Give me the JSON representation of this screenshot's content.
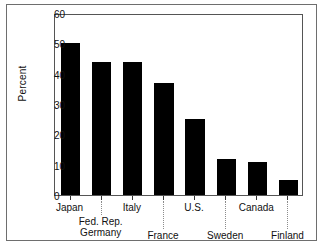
{
  "chart_data": {
    "type": "bar",
    "title": "",
    "xlabel": "",
    "ylabel": "Percent",
    "ylim": [
      0,
      60
    ],
    "yticks": [
      0,
      10,
      20,
      30,
      40,
      50,
      60
    ],
    "grid": false,
    "legend": false,
    "categories": [
      "Japan",
      "Fed. Rep. Germany",
      "Italy",
      "France",
      "U.S.",
      "Sweden",
      "Canada",
      "Finland"
    ],
    "category_labels": [
      {
        "line1": "Japan",
        "line2": "",
        "row": 1
      },
      {
        "line1": "Fed. Rep.",
        "line2": "Germany",
        "row": 2
      },
      {
        "line1": "Italy",
        "line2": "",
        "row": 1
      },
      {
        "line1": "France",
        "line2": "",
        "row": 3
      },
      {
        "line1": "U.S.",
        "line2": "",
        "row": 1
      },
      {
        "line1": "Sweden",
        "line2": "",
        "row": 3
      },
      {
        "line1": "Canada",
        "line2": "",
        "row": 1
      },
      {
        "line1": "Finland",
        "line2": "",
        "row": 3
      }
    ],
    "values": [
      50,
      44,
      44,
      37,
      25,
      12,
      11,
      5
    ],
    "bar_color": "#000000"
  }
}
